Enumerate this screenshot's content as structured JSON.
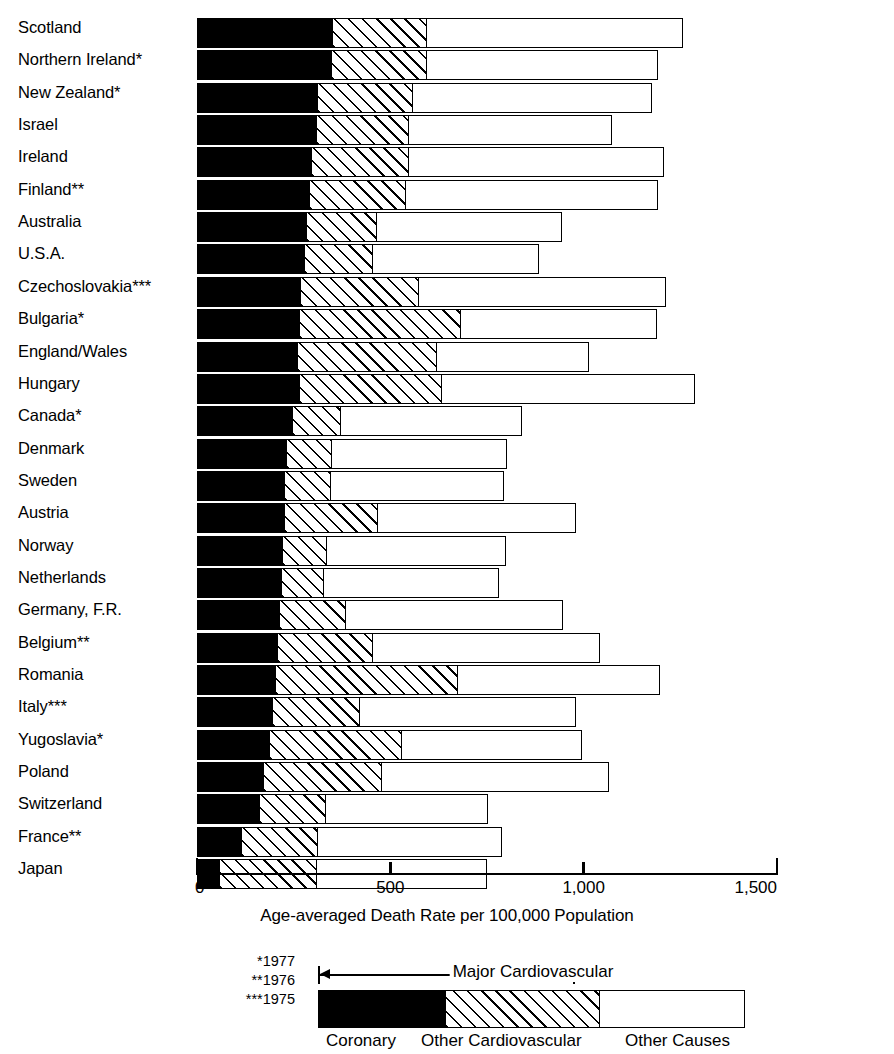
{
  "chart_data": {
    "type": "bar",
    "orientation": "horizontal",
    "stacked": true,
    "title": "",
    "xlabel": "Age-averaged Death Rate per 100,000 Population",
    "ylabel": "",
    "xlim": [
      0,
      1500
    ],
    "xticks": [
      0,
      500,
      1000,
      1500
    ],
    "xticklabels": [
      "0",
      "500",
      "1,000",
      "1,500"
    ],
    "grid": false,
    "legend_position": "bottom",
    "categories": [
      "Scotland",
      "Northern Ireland*",
      "New Zealand*",
      "Israel",
      "Ireland",
      "Finland**",
      "Australia",
      "U.S.A.",
      "Czechoslovakia***",
      "Bulgaria*",
      "England/Wales",
      "Hungary",
      "Canada*",
      "Denmark",
      "Sweden",
      "Austria",
      "Norway",
      "Netherlands",
      "Germany, F.R.",
      "Belgium**",
      "Romania",
      "Italy***",
      "Yugoslavia*",
      "Poland",
      "Switzerland",
      "France**",
      "Japan"
    ],
    "series": [
      {
        "name": "Coronary",
        "values": [
          352,
          350,
          315,
          312,
          300,
          295,
          287,
          282,
          270,
          268,
          262,
          268,
          250,
          235,
          230,
          228,
          225,
          222,
          215,
          212,
          205,
          198,
          190,
          175,
          165,
          118,
          62
        ]
      },
      {
        "name": "Other Cardiovascular",
        "values": [
          248,
          250,
          250,
          242,
          255,
          250,
          185,
          180,
          310,
          420,
          365,
          372,
          128,
          120,
          122,
          245,
          118,
          112,
          175,
          248,
          475,
          230,
          345,
          310,
          175,
          200,
          255
        ]
      },
      {
        "name": "Other Causes",
        "values": [
          665,
          600,
          620,
          528,
          660,
          655,
          480,
          430,
          640,
          510,
          395,
          655,
          470,
          455,
          450,
          515,
          465,
          455,
          565,
          590,
          525,
          560,
          470,
          590,
          420,
          480,
          440
        ]
      }
    ],
    "totals": [
      1265,
      1200,
      1185,
      1082,
      1215,
      1200,
      952,
      892,
      1220,
      1198,
      1022,
      1295,
      848,
      810,
      802,
      988,
      808,
      789,
      955,
      1050,
      1205,
      988,
      1005,
      1075,
      760,
      798,
      757
    ],
    "footnotes": [
      "*1977",
      "**1976",
      "***1975"
    ],
    "legend": {
      "span_label": "Major Cardiovascular",
      "entries": [
        "Coronary",
        "Other Cardiovascular",
        "Other Causes"
      ],
      "swatch_fills": [
        "solid-black",
        "diagonal-hatch",
        "white"
      ]
    },
    "colors": {
      "coronary": "#000000",
      "other_cardiovascular": "#ffffff",
      "other_causes": "#ffffff",
      "outline": "#000000",
      "background": "#ffffff"
    }
  }
}
